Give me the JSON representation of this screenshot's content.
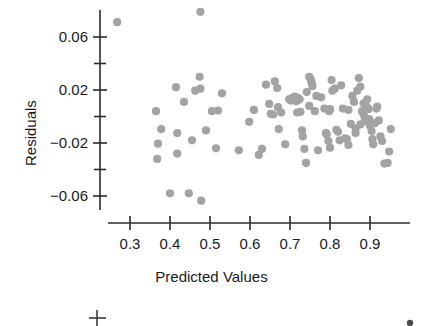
{
  "figure": {
    "kind": "residual-scatter-plot",
    "point_color": "#a3a3a3",
    "axis_color": "#2b2b2b",
    "text_color": "#1a1a1a",
    "background": "#ffffff"
  },
  "axes": {
    "x_title": "Predicted Values",
    "y_title": "Residuals",
    "x_tick_labels": [
      "0.3",
      "0.4",
      "0.5",
      "0.6",
      "0.7",
      "0.8",
      "0.9"
    ],
    "y_tick_labels": [
      "0.06",
      "0.02",
      "−0.02",
      "−0.06"
    ]
  },
  "fragment": {
    "note": "partial axis of the plot below, cropped at image bottom"
  },
  "chart_data": {
    "type": "scatter",
    "title": "",
    "xlabel": "Predicted Values",
    "ylabel": "Residuals",
    "xlim": [
      0.255,
      0.985
    ],
    "ylim": [
      -0.075,
      0.085
    ],
    "xticks": [
      0.3,
      0.4,
      0.5,
      0.6,
      0.7,
      0.8,
      0.9
    ],
    "yticks": [
      0.06,
      0.02,
      -0.02,
      -0.06
    ],
    "minor_yticks": [
      0.04,
      0.0,
      -0.04
    ],
    "grid": false,
    "legend": null,
    "marker": "circle",
    "marker_color": "#a3a3a3",
    "marker_size": 7,
    "points": [
      [
        0.268,
        0.0712
      ],
      [
        0.476,
        0.079
      ],
      [
        0.474,
        0.03
      ],
      [
        0.463,
        0.0195
      ],
      [
        0.476,
        0.021
      ],
      [
        0.415,
        0.022
      ],
      [
        0.435,
        0.011
      ],
      [
        0.418,
        -0.0125
      ],
      [
        0.49,
        -0.0105
      ],
      [
        0.455,
        -0.018
      ],
      [
        0.418,
        -0.028
      ],
      [
        0.515,
        -0.024
      ],
      [
        0.447,
        -0.058
      ],
      [
        0.478,
        -0.0635
      ],
      [
        0.365,
        0.004
      ],
      [
        0.378,
        -0.0095
      ],
      [
        0.37,
        -0.0205
      ],
      [
        0.368,
        -0.032
      ],
      [
        0.4,
        -0.058
      ],
      [
        0.53,
        0.0175
      ],
      [
        0.52,
        0.0045
      ],
      [
        0.505,
        0.004
      ],
      [
        0.572,
        -0.0255
      ],
      [
        0.598,
        -0.004
      ],
      [
        0.61,
        0.005
      ],
      [
        0.622,
        -0.029
      ],
      [
        0.63,
        -0.0245
      ],
      [
        0.64,
        0.024
      ],
      [
        0.648,
        0.0095
      ],
      [
        0.652,
        0.002
      ],
      [
        0.658,
        0.0015
      ],
      [
        0.662,
        0.0265
      ],
      [
        0.668,
        0.0215
      ],
      [
        0.67,
        0.007
      ],
      [
        0.672,
        -0.0095
      ],
      [
        0.678,
        0.003
      ],
      [
        0.688,
        -0.021
      ],
      [
        0.698,
        0.013
      ],
      [
        0.702,
        0.012
      ],
      [
        0.706,
        0.014
      ],
      [
        0.71,
        0.0125
      ],
      [
        0.712,
        0.015
      ],
      [
        0.716,
        0.0115
      ],
      [
        0.72,
        0.014
      ],
      [
        0.724,
        0.013
      ],
      [
        0.718,
        0.003
      ],
      [
        0.726,
        0.0035
      ],
      [
        0.73,
        -0.0105
      ],
      [
        0.732,
        -0.015
      ],
      [
        0.736,
        -0.0245
      ],
      [
        0.74,
        -0.035
      ],
      [
        0.748,
        0.03
      ],
      [
        0.752,
        0.028
      ],
      [
        0.754,
        0.0255
      ],
      [
        0.756,
        0.023
      ],
      [
        0.748,
        0.008
      ],
      [
        0.742,
        0.0185
      ],
      [
        0.762,
        0.004
      ],
      [
        0.766,
        0.0155
      ],
      [
        0.77,
        -0.0255
      ],
      [
        0.778,
        0.0145
      ],
      [
        0.786,
        0.006
      ],
      [
        0.79,
        -0.0125
      ],
      [
        0.792,
        -0.0135
      ],
      [
        0.796,
        -0.0185
      ],
      [
        0.798,
        0.004
      ],
      [
        0.8,
        0.0055
      ],
      [
        0.804,
        0.0275
      ],
      [
        0.806,
        0.0195
      ],
      [
        0.812,
        0.021
      ],
      [
        0.8,
        -0.0235
      ],
      [
        0.816,
        -0.01
      ],
      [
        0.82,
        -0.0115
      ],
      [
        0.824,
        -0.018
      ],
      [
        0.828,
        0.0235
      ],
      [
        0.832,
        0.006
      ],
      [
        0.838,
        -0.0165
      ],
      [
        0.842,
        -0.017
      ],
      [
        0.846,
        -0.0215
      ],
      [
        0.856,
        0.0155
      ],
      [
        0.86,
        0.011
      ],
      [
        0.864,
        -0.0125
      ],
      [
        0.868,
        0.0195
      ],
      [
        0.872,
        0.029
      ],
      [
        0.876,
        0.0225
      ],
      [
        0.88,
        0.004
      ],
      [
        0.882,
        0.003
      ],
      [
        0.886,
        0.0
      ],
      [
        0.888,
        -0.0035
      ],
      [
        0.89,
        0.008
      ],
      [
        0.894,
        0.0065
      ],
      [
        0.896,
        0.0055
      ],
      [
        0.898,
        -0.002
      ],
      [
        0.9,
        -0.007
      ],
      [
        0.904,
        -0.011
      ],
      [
        0.906,
        -0.017
      ],
      [
        0.908,
        -0.021
      ],
      [
        0.912,
        -0.005
      ],
      [
        0.916,
        0.006
      ],
      [
        0.918,
        0.0075
      ],
      [
        0.922,
        -0.003
      ],
      [
        0.926,
        -0.015
      ],
      [
        0.93,
        -0.0185
      ],
      [
        0.936,
        -0.0355
      ],
      [
        0.944,
        -0.035
      ],
      [
        0.948,
        -0.0265
      ],
      [
        0.952,
        -0.0095
      ],
      [
        0.893,
        0.013
      ],
      [
        0.884,
        0.01
      ],
      [
        0.876,
        -0.006
      ],
      [
        0.864,
        -0.009
      ],
      [
        0.852,
        -0.0055
      ],
      [
        0.846,
        0.005
      ]
    ]
  }
}
